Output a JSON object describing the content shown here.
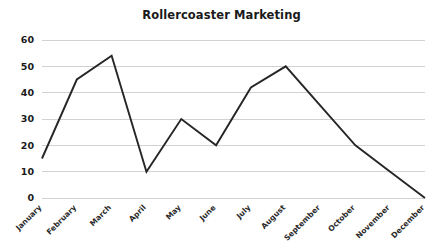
{
  "chart_data": {
    "type": "line",
    "title": "Rollercoaster Marketing",
    "xlabel": "",
    "ylabel": "",
    "categories": [
      "January",
      "February",
      "March",
      "April",
      "May",
      "June",
      "July",
      "August",
      "September",
      "October",
      "November",
      "December"
    ],
    "values": [
      15,
      45,
      54,
      10,
      30,
      20,
      42,
      50,
      35,
      20,
      10,
      0
    ],
    "series": [
      {
        "name": "Rollercoaster Marketing",
        "values": [
          15,
          45,
          54,
          10,
          30,
          20,
          42,
          50,
          35,
          20,
          10,
          0
        ]
      }
    ],
    "ylim": [
      0,
      60
    ],
    "yticks": [
      0,
      10,
      20,
      30,
      40,
      50,
      60
    ],
    "ytick_labels": [
      "0",
      "10",
      "20",
      "30",
      "40",
      "50",
      "60"
    ],
    "grid": "horizontal",
    "legend": "none",
    "xtick_rotation": 45,
    "colors": {
      "line": "#262626",
      "gridline": "#d2d2d2",
      "background": "#ffffff",
      "title_text": "#1a1a1a",
      "tick_text": "#1a1a1a"
    }
  }
}
